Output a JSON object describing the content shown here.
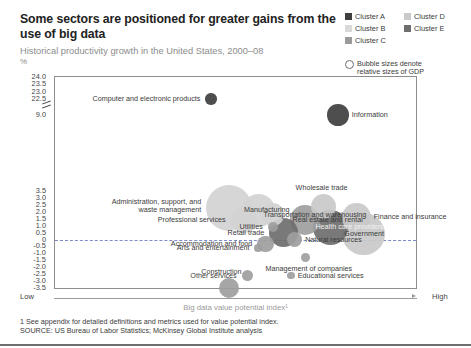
{
  "header": {
    "title": "Some sectors are positioned for greater gains from the use of big data",
    "subtitle": "Historical productivity growth in the United States, 2000–08",
    "unit": "%"
  },
  "legend": {
    "items": [
      {
        "label": "Cluster A",
        "color": "#3f3f3f"
      },
      {
        "label": "Cluster B",
        "color": "#d9d9d9"
      },
      {
        "label": "Cluster C",
        "color": "#9a9a9a"
      },
      {
        "label": "Cluster D",
        "color": "#c9c9c9"
      },
      {
        "label": "Cluster E",
        "color": "#6e6e6e"
      }
    ],
    "bubble_note_line1": "Bubble sizes denote",
    "bubble_note_line2": "relative sizes of GDP",
    "bubble_icon": "circle-outline-icon"
  },
  "axis": {
    "x_low": "Low",
    "x_high": "High",
    "x_title": "Big data value potential index¹",
    "y_ticks": [
      "24.0",
      "23.5",
      "23.0",
      "22.5",
      "9.0",
      "3.5",
      "3.0",
      "2.5",
      "2.0",
      "1.5",
      "1.0",
      "0.5",
      "0",
      "-0.5",
      "-1.0",
      "-1.5",
      "-2.0",
      "-2.5",
      "-3.0",
      "-3.5"
    ]
  },
  "footer": {
    "note": "1  See appendix for detailed definitions and metrics used for value potential index.",
    "source": "SOURCE:  US Bureau of Labor Statistics; McKinsey Global Institute analysis"
  },
  "chart_data": {
    "type": "scatter",
    "title": "Some sectors are positioned for greater gains from the use of big data",
    "subtitle": "Historical productivity growth in the United States, 2000–08",
    "xlabel": "Big data value potential index¹",
    "ylabel": "%",
    "ylim": [
      -3.5,
      24.0
    ],
    "xlim": [
      0,
      100
    ],
    "grid": false,
    "legend_position": "top-right",
    "y_axis_break_between": [
      9.0,
      22.5
    ],
    "zero_reference_line": 0,
    "bubble_meaning": "Bubble sizes denote relative sizes of GDP",
    "points": [
      {
        "label": "Computer and electronic products",
        "x": 43,
        "y": 22.5,
        "size": 5,
        "cluster": "A",
        "label_pos": "left"
      },
      {
        "label": "Information",
        "x": 78,
        "y": 9.0,
        "size": 13,
        "cluster": "A",
        "label_pos": "right"
      },
      {
        "label": "Administration, support, and waste management",
        "x": 48,
        "y": 2.3,
        "size": 33,
        "cluster": "B",
        "label_pos": "left"
      },
      {
        "label": "Manufacturing",
        "x": 56,
        "y": 2.1,
        "size": 22,
        "cluster": "B",
        "label_pos": "inside"
      },
      {
        "label": "Wholesale trade",
        "x": 74,
        "y": 2.4,
        "size": 16,
        "cluster": "D",
        "label_pos": "above"
      },
      {
        "label": "Transportation and warehousing",
        "x": 60,
        "y": 1.8,
        "size": 14,
        "cluster": "B",
        "label_pos": "inside"
      },
      {
        "label": "Professional services",
        "x": 52,
        "y": 1.4,
        "size": 17,
        "cluster": "B",
        "label_pos": "left"
      },
      {
        "label": "Real estate and rental",
        "x": 69,
        "y": 1.4,
        "size": 20,
        "cluster": "C",
        "label_pos": "inside"
      },
      {
        "label": "Finance and insurance",
        "x": 83,
        "y": 1.6,
        "size": 19,
        "cluster": "D",
        "label_pos": "right"
      },
      {
        "label": "Utilities",
        "x": 60,
        "y": 0.9,
        "size": 4,
        "cluster": "C",
        "label_pos": "left"
      },
      {
        "label": "Health care providers",
        "x": 76,
        "y": 0.9,
        "size": 24,
        "cluster": "E",
        "label_pos": "inside"
      },
      {
        "label": "Retail trade",
        "x": 63,
        "y": 0.5,
        "size": 19,
        "cluster": "E",
        "label_pos": "left"
      },
      {
        "label": "Government",
        "x": 85,
        "y": 0.4,
        "size": 30,
        "cluster": "D",
        "label_pos": "inside"
      },
      {
        "label": "Natural resources",
        "x": 66,
        "y": 0.0,
        "size": 8,
        "cluster": "C",
        "label_pos": "right"
      },
      {
        "label": "Accommodation and food",
        "x": 58,
        "y": -0.3,
        "size": 9,
        "cluster": "C",
        "label_pos": "left"
      },
      {
        "label": "Arts and entertainment",
        "x": 56,
        "y": -0.6,
        "size": 2,
        "cluster": "C",
        "label_pos": "left"
      },
      {
        "label": "Management of companies",
        "x": 69,
        "y": -1.3,
        "size": 3,
        "cluster": "C",
        "label_pos": "below"
      },
      {
        "label": "Educational services",
        "x": 65,
        "y": -2.6,
        "size": 2,
        "cluster": "C",
        "label_pos": "right"
      },
      {
        "label": "Other services",
        "x": 53,
        "y": -2.6,
        "size": 5,
        "cluster": "C",
        "label_pos": "left"
      },
      {
        "label": "Construction",
        "x": 48,
        "y": -3.5,
        "size": 12,
        "cluster": "C",
        "label_pos": "above"
      }
    ]
  }
}
